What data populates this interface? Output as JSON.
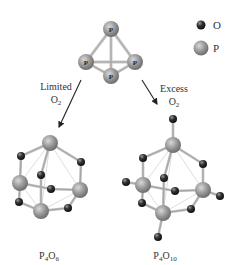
{
  "legend": {
    "items": [
      {
        "symbol": "O",
        "label": "O",
        "type": "oxygen-atom"
      },
      {
        "symbol": "P",
        "label": "P",
        "type": "phosphorus-atom"
      }
    ]
  },
  "reactant": {
    "formula": "P4",
    "atom_label": "P",
    "atoms": [
      {
        "el": "P",
        "x": 111,
        "y": 29
      },
      {
        "el": "P",
        "x": 86,
        "y": 62
      },
      {
        "el": "P",
        "x": 135,
        "y": 62
      },
      {
        "el": "P",
        "x": 111,
        "y": 76
      }
    ]
  },
  "paths": [
    {
      "condition_line1": "Limited",
      "condition_line2_base": "O",
      "condition_line2_sub": "2",
      "product_base": "P",
      "product_sub1": "4",
      "product_mid": "O",
      "product_sub2": "6"
    },
    {
      "condition_line1": "Excess",
      "condition_line2_base": "O",
      "condition_line2_sub": "2",
      "product_base": "P",
      "product_sub1": "4",
      "product_mid": "O",
      "product_sub2": "10"
    }
  ],
  "colors": {
    "phosphorus": "#9a9a9a",
    "oxygen": "#2b2b2b",
    "bond": "#b5b5b5",
    "arrow": "#222222",
    "text": "#333333"
  }
}
